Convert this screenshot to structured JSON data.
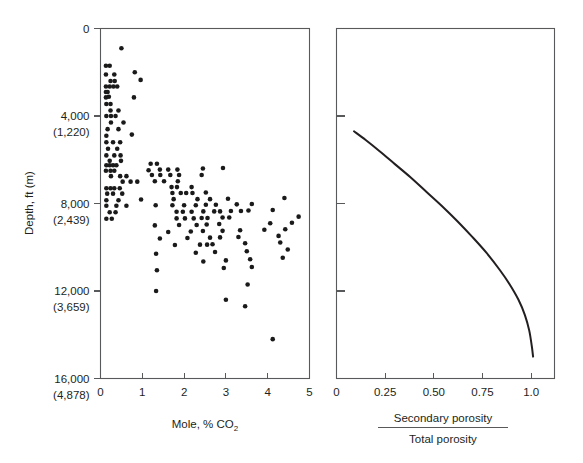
{
  "figure": {
    "background_color": "#ffffff",
    "ink_color": "#231f20",
    "axis_color": "#58595b"
  },
  "chart_data": [
    {
      "type": "scatter",
      "panel": "left",
      "title": "",
      "xlabel": "Mole, % CO2",
      "xlabel_display": "Mole, % CO",
      "xlabel_subscript": "2",
      "ylabel": "Depth, ft (m)",
      "xlim": [
        0,
        5
      ],
      "ylim": [
        16000,
        0
      ],
      "y_inverted": true,
      "grid": false,
      "legend": "none",
      "xticks": [
        0,
        1,
        2,
        3,
        4,
        5
      ],
      "xticklabels": [
        "0",
        "1",
        "2",
        "3",
        "4",
        "5"
      ],
      "yticks": [
        0,
        4000,
        8000,
        12000,
        16000
      ],
      "yticklabels": [
        {
          "ft": "0",
          "m": ""
        },
        {
          "ft": "4,000",
          "m": "(1,220)"
        },
        {
          "ft": "8,000",
          "m": "(2,439)"
        },
        {
          "ft": "12,000",
          "m": "(3,659)"
        },
        {
          "ft": "16,000",
          "m": "(4,878)"
        }
      ],
      "marker": "filled-circle",
      "marker_color": "#1a1a1a",
      "marker_size_px": 4.6,
      "point_count": 152,
      "points": [
        [
          0.5,
          900
        ],
        [
          0.13,
          1700
        ],
        [
          0.22,
          1700
        ],
        [
          0.13,
          2100
        ],
        [
          0.33,
          2100
        ],
        [
          0.82,
          2000
        ],
        [
          0.24,
          2400
        ],
        [
          0.34,
          2400
        ],
        [
          0.96,
          2350
        ],
        [
          0.13,
          2650
        ],
        [
          0.22,
          2650
        ],
        [
          0.31,
          2650
        ],
        [
          0.4,
          2650
        ],
        [
          0.13,
          2900
        ],
        [
          0.17,
          2900
        ],
        [
          0.13,
          3150
        ],
        [
          0.2,
          3120
        ],
        [
          0.8,
          3150
        ],
        [
          0.14,
          3450
        ],
        [
          0.24,
          3450
        ],
        [
          0.24,
          3750
        ],
        [
          0.43,
          3750
        ],
        [
          0.14,
          4000
        ],
        [
          0.25,
          4000
        ],
        [
          0.36,
          4000
        ],
        [
          0.25,
          4300
        ],
        [
          0.55,
          4300
        ],
        [
          0.17,
          4600
        ],
        [
          0.43,
          4600
        ],
        [
          0.14,
          4900
        ],
        [
          0.75,
          4850
        ],
        [
          0.14,
          5200
        ],
        [
          0.3,
          5200
        ],
        [
          0.47,
          5200
        ],
        [
          0.18,
          5500
        ],
        [
          0.4,
          5500
        ],
        [
          0.14,
          5800
        ],
        [
          0.33,
          5800
        ],
        [
          0.48,
          5800
        ],
        [
          0.22,
          6050
        ],
        [
          0.49,
          6050
        ],
        [
          0.14,
          6250
        ],
        [
          0.22,
          6250
        ],
        [
          0.3,
          6250
        ],
        [
          0.38,
          6250
        ],
        [
          1.2,
          6180
        ],
        [
          1.35,
          6180
        ],
        [
          0.13,
          6500
        ],
        [
          0.24,
          6500
        ],
        [
          0.33,
          6500
        ],
        [
          1.15,
          6480
        ],
        [
          1.42,
          6450
        ],
        [
          1.62,
          6450
        ],
        [
          1.84,
          6450
        ],
        [
          2.45,
          6400
        ],
        [
          2.93,
          6380
        ],
        [
          0.25,
          6750
        ],
        [
          0.47,
          6750
        ],
        [
          0.62,
          6750
        ],
        [
          1.23,
          6700
        ],
        [
          1.43,
          6700
        ],
        [
          1.67,
          6700
        ],
        [
          1.88,
          6700
        ],
        [
          2.42,
          6700
        ],
        [
          0.53,
          7000
        ],
        [
          0.72,
          7000
        ],
        [
          0.88,
          7000
        ],
        [
          1.3,
          6980
        ],
        [
          1.52,
          6980
        ],
        [
          1.85,
          6980
        ],
        [
          0.14,
          7300
        ],
        [
          0.24,
          7300
        ],
        [
          0.33,
          7300
        ],
        [
          0.46,
          7300
        ],
        [
          1.7,
          7250
        ],
        [
          1.83,
          7250
        ],
        [
          2.18,
          7250
        ],
        [
          0.16,
          7550
        ],
        [
          0.3,
          7550
        ],
        [
          0.52,
          7550
        ],
        [
          1.72,
          7520
        ],
        [
          1.92,
          7520
        ],
        [
          2.05,
          7520
        ],
        [
          2.2,
          7520
        ],
        [
          2.52,
          7500
        ],
        [
          0.14,
          7850
        ],
        [
          0.43,
          7850
        ],
        [
          0.97,
          7820
        ],
        [
          1.75,
          7800
        ],
        [
          2.32,
          7800
        ],
        [
          2.62,
          7800
        ],
        [
          3.05,
          7780
        ],
        [
          4.4,
          7750
        ],
        [
          0.14,
          8100
        ],
        [
          0.38,
          8100
        ],
        [
          0.62,
          8100
        ],
        [
          1.32,
          8080
        ],
        [
          1.72,
          8080
        ],
        [
          2.0,
          8080
        ],
        [
          2.28,
          8080
        ],
        [
          2.52,
          8060
        ],
        [
          2.76,
          8060
        ],
        [
          3.26,
          8040
        ],
        [
          3.62,
          8020
        ],
        [
          0.22,
          8400
        ],
        [
          0.36,
          8400
        ],
        [
          1.82,
          8380
        ],
        [
          1.97,
          8380
        ],
        [
          2.18,
          8380
        ],
        [
          2.46,
          8360
        ],
        [
          2.72,
          8360
        ],
        [
          2.86,
          8360
        ],
        [
          3.12,
          8340
        ],
        [
          3.36,
          8340
        ],
        [
          3.54,
          8320
        ],
        [
          4.12,
          8300
        ],
        [
          0.14,
          8700
        ],
        [
          0.27,
          8700
        ],
        [
          1.82,
          8680
        ],
        [
          2.02,
          8680
        ],
        [
          2.23,
          8680
        ],
        [
          2.42,
          8660
        ],
        [
          2.56,
          8660
        ],
        [
          2.92,
          8640
        ],
        [
          3.08,
          8640
        ],
        [
          4.74,
          8600
        ],
        [
          1.3,
          9000
        ],
        [
          1.88,
          8980
        ],
        [
          2.3,
          8980
        ],
        [
          2.54,
          8960
        ],
        [
          2.84,
          8940
        ],
        [
          4.06,
          8900
        ],
        [
          4.58,
          8880
        ],
        [
          1.62,
          9300
        ],
        [
          2.16,
          9280
        ],
        [
          2.45,
          9260
        ],
        [
          2.92,
          9250
        ],
        [
          3.34,
          9220
        ],
        [
          3.92,
          9200
        ],
        [
          4.42,
          9180
        ],
        [
          1.42,
          9600
        ],
        [
          2.08,
          9580
        ],
        [
          2.62,
          9560
        ],
        [
          2.86,
          9550
        ],
        [
          3.3,
          9530
        ],
        [
          4.26,
          9480
        ],
        [
          1.78,
          9900
        ],
        [
          2.38,
          9880
        ],
        [
          2.55,
          9880
        ],
        [
          2.68,
          9860
        ],
        [
          3.46,
          9820
        ],
        [
          4.3,
          9780
        ],
        [
          1.33,
          10300
        ],
        [
          2.28,
          10250
        ],
        [
          2.74,
          10220
        ],
        [
          3.5,
          10180
        ],
        [
          4.48,
          10100
        ],
        [
          2.46,
          10650
        ],
        [
          3.0,
          10600
        ],
        [
          3.58,
          10550
        ],
        [
          4.36,
          10480
        ],
        [
          1.35,
          11050
        ],
        [
          2.95,
          10950
        ],
        [
          3.62,
          10900
        ],
        [
          1.33,
          12000
        ],
        [
          3.52,
          11700
        ],
        [
          3.0,
          12400
        ],
        [
          3.46,
          12700
        ],
        [
          4.12,
          14200
        ]
      ]
    },
    {
      "type": "line",
      "panel": "right",
      "title": "",
      "xlabel_numerator": "Secondary porosity",
      "xlabel_denominator": "Total porosity",
      "ylabel": "",
      "xlim": [
        0,
        1.12
      ],
      "ylim": [
        16000,
        0
      ],
      "y_inverted": true,
      "grid": false,
      "legend": "none",
      "xticks": [
        0,
        0.25,
        0.5,
        0.75,
        1.0
      ],
      "xticklabels": [
        "0",
        "0.25",
        "0.50",
        "0.75",
        "1.0"
      ],
      "yticks": [
        4000,
        8000,
        12000
      ],
      "yticklabels": [
        "",
        "",
        ""
      ],
      "line_color": "#231f20",
      "line_width_px": 2.0,
      "series": [
        {
          "name": "secondary-porosity-trend",
          "x": [
            0.09,
            0.15,
            0.22,
            0.3,
            0.38,
            0.46,
            0.54,
            0.62,
            0.7,
            0.77,
            0.84,
            0.89,
            0.935,
            0.968,
            0.99,
            1.003,
            1.01
          ],
          "y": [
            4700,
            5100,
            5600,
            6200,
            6800,
            7450,
            8100,
            8800,
            9550,
            10250,
            11050,
            11700,
            12400,
            13100,
            13800,
            14500,
            15000
          ]
        }
      ]
    }
  ]
}
